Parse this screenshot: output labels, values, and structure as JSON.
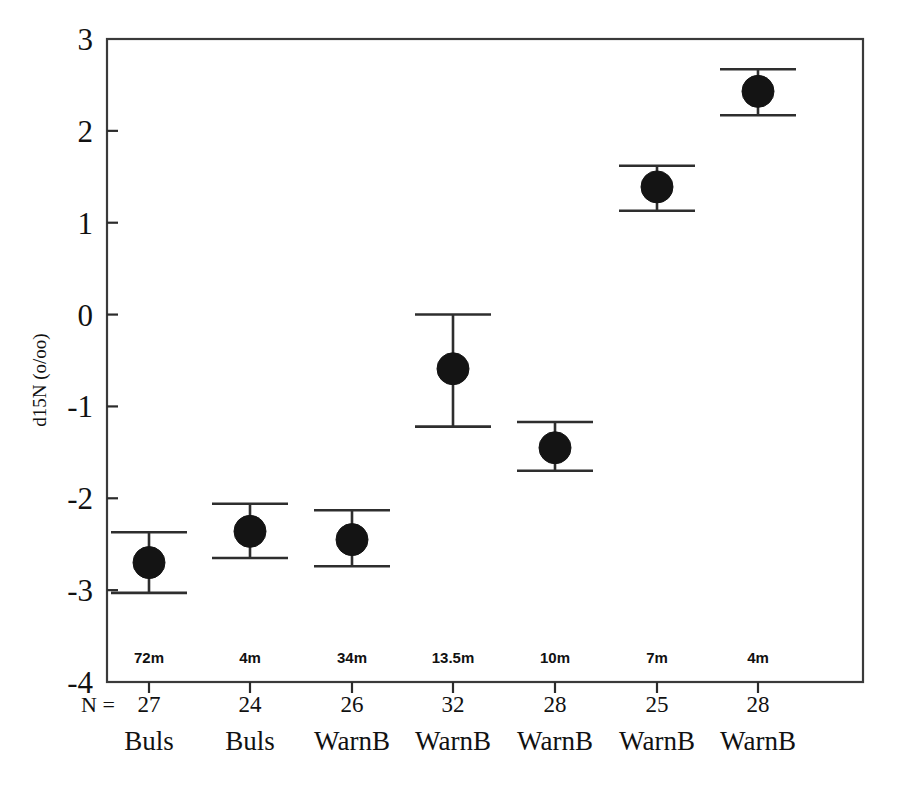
{
  "chart_data": {
    "type": "scatter",
    "title": "",
    "xlabel": "",
    "ylabel": "d15N (o/oo)",
    "ylim": [
      -4,
      3
    ],
    "yticks": [
      3,
      2,
      1,
      0,
      -1,
      -2,
      -3,
      -4
    ],
    "ytick_labels": [
      "3",
      "2",
      "1",
      "0",
      "-1",
      "-2",
      "-3",
      "-4"
    ],
    "grid": false,
    "legend": "none",
    "error_bar_style": "mean with error bar caps",
    "n_prefix_label": "N =",
    "categories": [
      "Buls",
      "Buls",
      "WarnB",
      "WarnB",
      "WarnB",
      "WarnB",
      "WarnB"
    ],
    "depth_labels": [
      "72m",
      "4m",
      "34m",
      "13.5m",
      "10m",
      "7m",
      "4m"
    ],
    "n_values": [
      27,
      24,
      26,
      32,
      28,
      25,
      28
    ],
    "values": [
      -2.7,
      -2.36,
      -2.45,
      -0.59,
      -1.45,
      1.39,
      2.43
    ],
    "error_upper": [
      -2.37,
      -2.06,
      -2.13,
      0.0,
      -1.17,
      1.62,
      2.67
    ],
    "error_lower": [
      -3.03,
      -2.65,
      -2.74,
      -1.22,
      -1.7,
      1.13,
      2.17
    ],
    "points": [
      {
        "index": 1,
        "depth": "72m",
        "n": 27,
        "category": "Buls",
        "value": -2.7,
        "upper": -2.37,
        "lower": -3.03
      },
      {
        "index": 2,
        "depth": "4m",
        "n": 24,
        "category": "Buls",
        "value": -2.36,
        "upper": -2.06,
        "lower": -2.65
      },
      {
        "index": 3,
        "depth": "34m",
        "n": 26,
        "category": "WarnB",
        "value": -2.45,
        "upper": -2.13,
        "lower": -2.74
      },
      {
        "index": 4,
        "depth": "13.5m",
        "n": 32,
        "category": "WarnB",
        "value": -0.59,
        "upper": 0.0,
        "lower": -1.22
      },
      {
        "index": 5,
        "depth": "10m",
        "n": 28,
        "category": "WarnB",
        "value": -1.45,
        "upper": -1.17,
        "lower": -1.7
      },
      {
        "index": 6,
        "depth": "7m",
        "n": 25,
        "category": "WarnB",
        "value": 1.39,
        "upper": 1.62,
        "lower": 1.13
      },
      {
        "index": 7,
        "depth": "4m",
        "n": 28,
        "category": "WarnB",
        "value": 2.43,
        "upper": 2.67,
        "lower": 2.17
      }
    ],
    "colors": {
      "marker": "#141414",
      "error_bar": "#2e2e2e",
      "axis": "#3a3a3a",
      "text": "#111111",
      "background": "#ffffff"
    }
  }
}
